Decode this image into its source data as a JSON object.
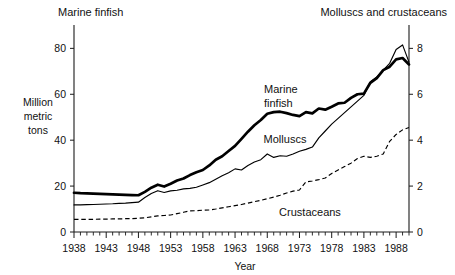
{
  "chart_data": {
    "type": "line",
    "title": "",
    "xlabel": "Year",
    "ylabel": "Million metric tons",
    "left_axis_title": "Marine finfish",
    "right_axis_title": "Molluscs and crustaceans",
    "ylim": [
      0,
      88
    ],
    "ylim_right": [
      0,
      8.8
    ],
    "xlim": [
      1938,
      1990
    ],
    "grid": false,
    "legend_position": "inline-annotations",
    "yticks": [
      0,
      20,
      40,
      60,
      80
    ],
    "yticks_right": [
      0,
      2,
      4,
      6,
      8
    ],
    "xticks": [
      1938,
      1943,
      1948,
      1953,
      1958,
      1963,
      1968,
      1973,
      1978,
      1983,
      1988
    ],
    "xtick_minor_step": 1,
    "x": [
      1938,
      1939,
      1940,
      1941,
      1942,
      1943,
      1944,
      1945,
      1946,
      1947,
      1948,
      1949,
      1950,
      1951,
      1952,
      1953,
      1954,
      1955,
      1956,
      1957,
      1958,
      1959,
      1960,
      1961,
      1962,
      1963,
      1964,
      1965,
      1966,
      1967,
      1968,
      1969,
      1970,
      1971,
      1972,
      1973,
      1974,
      1975,
      1976,
      1977,
      1978,
      1979,
      1980,
      1981,
      1982,
      1983,
      1984,
      1985,
      1986,
      1987,
      1988,
      1989,
      1990
    ],
    "series": [
      {
        "name": "Marine finfish",
        "axis": "left",
        "style": "solid-thick",
        "unit": "million metric tons",
        "values": [
          17.1,
          16.9,
          16.8,
          16.7,
          16.6,
          16.5,
          16.4,
          16.3,
          16.2,
          16.1,
          16.0,
          17.5,
          19.3,
          20.6,
          19.8,
          21.0,
          22.4,
          23.3,
          24.8,
          26.0,
          27.0,
          29.0,
          31.5,
          33.0,
          35.3,
          37.5,
          40.6,
          43.7,
          46.5,
          48.8,
          51.5,
          52.2,
          52.4,
          51.8,
          51.0,
          50.5,
          52.2,
          51.7,
          53.8,
          53.3,
          54.6,
          56.0,
          56.3,
          58.4,
          60.0,
          60.3,
          65.0,
          67.0,
          70.5,
          72.0,
          75.2,
          75.8,
          73.0
        ]
      },
      {
        "name": "Molluscs",
        "axis": "right",
        "style": "solid-thin",
        "unit": "million metric tons",
        "values": [
          1.18,
          1.18,
          1.19,
          1.2,
          1.21,
          1.22,
          1.23,
          1.25,
          1.26,
          1.28,
          1.3,
          1.5,
          1.68,
          1.8,
          1.72,
          1.79,
          1.82,
          1.88,
          1.9,
          1.95,
          2.05,
          2.15,
          2.3,
          2.45,
          2.58,
          2.75,
          2.7,
          2.9,
          3.05,
          3.15,
          3.4,
          3.25,
          3.32,
          3.3,
          3.4,
          3.52,
          3.6,
          3.7,
          4.1,
          4.4,
          4.7,
          4.95,
          5.2,
          5.45,
          5.7,
          5.95,
          6.55,
          6.75,
          7.05,
          7.35,
          7.95,
          8.15,
          7.4
        ]
      },
      {
        "name": "Crustaceans",
        "axis": "right",
        "style": "dashed",
        "unit": "million metric tons",
        "values": [
          0.55,
          0.55,
          0.55,
          0.55,
          0.56,
          0.56,
          0.57,
          0.57,
          0.58,
          0.58,
          0.6,
          0.62,
          0.66,
          0.7,
          0.72,
          0.74,
          0.8,
          0.86,
          0.92,
          0.93,
          0.95,
          0.96,
          1.0,
          1.05,
          1.1,
          1.15,
          1.2,
          1.26,
          1.32,
          1.38,
          1.45,
          1.52,
          1.6,
          1.7,
          1.78,
          1.83,
          2.18,
          2.22,
          2.28,
          2.35,
          2.55,
          2.7,
          2.85,
          3.0,
          3.2,
          3.3,
          3.25,
          3.3,
          3.4,
          3.95,
          4.25,
          4.45,
          4.55
        ]
      }
    ],
    "annotations": [
      {
        "text": "Marine finfish",
        "series": "Marine finfish",
        "x": 1968,
        "placement": "above-left"
      },
      {
        "text": "Molluscs",
        "series": "Molluscs",
        "x": 1969,
        "placement": "above"
      },
      {
        "text": "Crustaceans",
        "series": "Crustaceans",
        "x": 1973,
        "placement": "below"
      }
    ]
  },
  "axes": {
    "left_top_label": "Marine finfish",
    "right_top_label": "Molluscs and crustaceans",
    "y_label_lines": [
      "Million",
      "metric",
      "tons"
    ],
    "x_label": "Year"
  },
  "colors": {
    "ink": "#000000",
    "background": "#ffffff"
  }
}
